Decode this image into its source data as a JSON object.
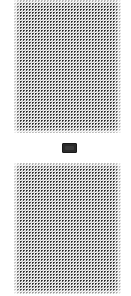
{
  "page": {
    "background_color": "#ffffff",
    "width": 131,
    "height": 296
  },
  "blocks": [
    {
      "name": "halftone-pattern-top",
      "description": "dithered halftone dot field",
      "x": 14,
      "y": 0,
      "width": 107,
      "height": 133,
      "dot_color": "#2a2a2a",
      "background_color": "#ffffff",
      "pitch_px": 3
    },
    {
      "name": "halftone-pattern-bottom",
      "description": "dithered halftone dot field",
      "x": 14,
      "y": 163,
      "width": 107,
      "height": 131,
      "dot_color": "#2a2a2a",
      "background_color": "#ffffff",
      "pitch_px": 3
    }
  ],
  "separator": {
    "name": "separator-chip",
    "label": "",
    "x": 62,
    "y": 143,
    "width": 15,
    "height": 10,
    "fill_color": "#2b2b2b",
    "border_color": "#1a1a1a"
  }
}
